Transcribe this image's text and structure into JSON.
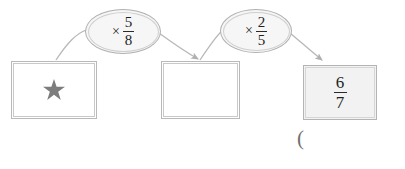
{
  "diagram": {
    "type": "function-machine-flow",
    "background_color": "#ffffff",
    "nodes": [
      {
        "id": "box-start",
        "kind": "box",
        "content_type": "star",
        "value": "★",
        "icon": "star-icon",
        "fill": "#ffffff"
      },
      {
        "id": "box-middle",
        "kind": "box",
        "content_type": "empty",
        "value": "",
        "fill": "#ffffff"
      },
      {
        "id": "box-result",
        "kind": "box",
        "content_type": "fraction",
        "numerator": "6",
        "denominator": "7",
        "fill": "#f2f2f2"
      }
    ],
    "operators": [
      {
        "id": "oval-first",
        "symbol": "×",
        "numerator": "5",
        "denominator": "8",
        "fill": "#f6f6f6"
      },
      {
        "id": "oval-second",
        "symbol": "×",
        "numerator": "2",
        "denominator": "5",
        "fill": "#f6f6f6"
      }
    ],
    "stray_mark": "(",
    "stroke_color": "#b0b0b0",
    "text_color": "#1f1f1f"
  }
}
